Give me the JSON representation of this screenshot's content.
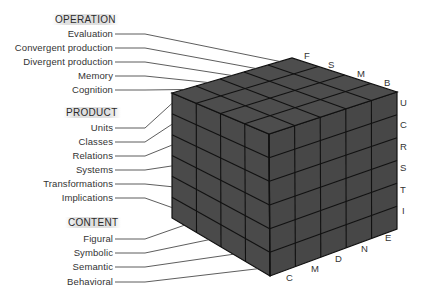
{
  "diagram": {
    "colors": {
      "cube_fill": "#4a4a4a",
      "cube_top": "#4d4d4d",
      "grid_line": "#111111",
      "label_text": "#333333",
      "leader_line": "#333333"
    },
    "operation": {
      "header": "OPERATION",
      "items": [
        "Evaluation",
        "Convergent production",
        "Divergent production",
        "Memory",
        "Cognition"
      ],
      "axis_letters": [
        "F",
        "S",
        "M",
        "B"
      ]
    },
    "product": {
      "header": "PRODUCT",
      "items": [
        "Units",
        "Classes",
        "Relations",
        "Systems",
        "Transformations",
        "Implications"
      ],
      "axis_letters": [
        "U",
        "C",
        "R",
        "S",
        "T",
        "I"
      ]
    },
    "content": {
      "header": "CONTENT",
      "items": [
        "Figural",
        "Symbolic",
        "Semantic",
        "Behavioral"
      ],
      "axis_letters": [
        "C",
        "M",
        "D",
        "N",
        "E"
      ]
    }
  }
}
